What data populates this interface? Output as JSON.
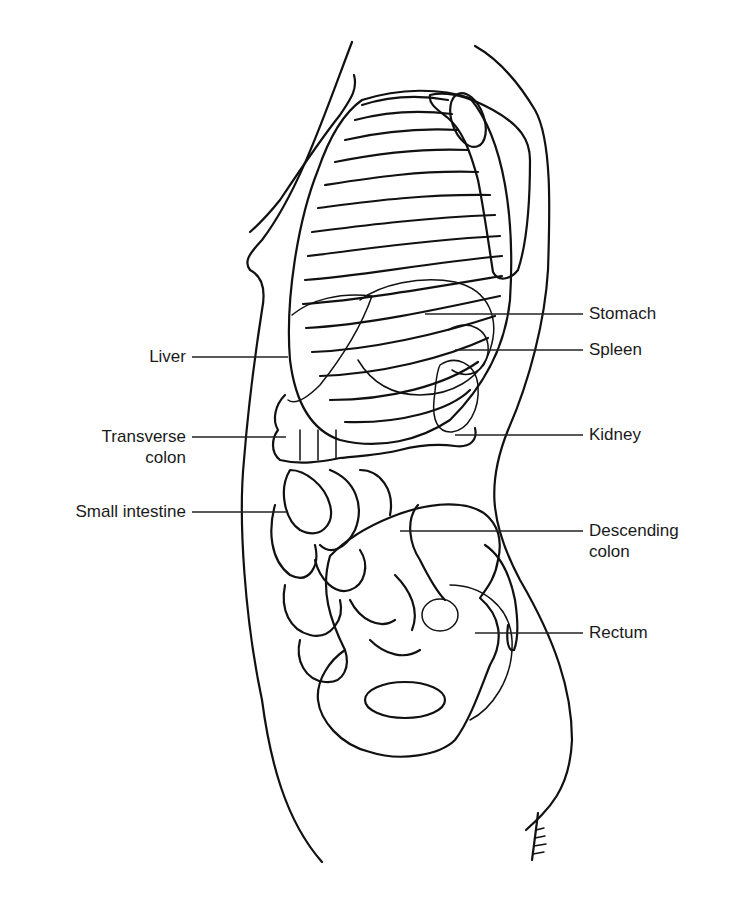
{
  "figure": {
    "background": "#ffffff",
    "ink": "#111111"
  },
  "labels": {
    "left": [
      {
        "id": "liver",
        "text": "Liver",
        "x": 102,
        "y": 350,
        "line": [
          192,
          357,
          288,
          357
        ]
      },
      {
        "id": "transverse-colon",
        "text": "Transverse\ncolon",
        "x": 78,
        "y": 430,
        "line": [
          192,
          437,
          286,
          437
        ]
      },
      {
        "id": "small-intestine",
        "text": "Small intestine",
        "x": 18,
        "y": 503,
        "line": [
          192,
          512,
          286,
          512
        ]
      }
    ],
    "right": [
      {
        "id": "stomach",
        "text": "Stomach",
        "x": 589,
        "y": 305,
        "line": [
          425,
          314,
          583,
          314
        ]
      },
      {
        "id": "spleen",
        "text": "Spleen",
        "x": 589,
        "y": 342,
        "line": [
          455,
          350,
          583,
          350
        ]
      },
      {
        "id": "kidney",
        "text": "Kidney",
        "x": 589,
        "y": 428,
        "line": [
          455,
          435,
          583,
          435
        ]
      },
      {
        "id": "descending-colon",
        "text": "Descending\ncolon",
        "x": 589,
        "y": 523,
        "line": [
          400,
          531,
          583,
          531
        ]
      },
      {
        "id": "rectum",
        "text": "Rectum",
        "x": 589,
        "y": 626,
        "line": [
          475,
          633,
          583,
          633
        ]
      }
    ]
  },
  "signature": "artist signature"
}
